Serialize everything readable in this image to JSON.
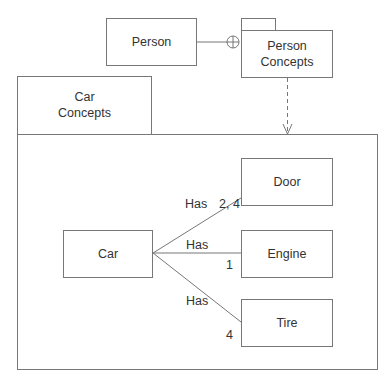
{
  "diagram": {
    "type": "UML package diagram",
    "packages": [
      {
        "id": "person_concepts",
        "name_line1": "Person",
        "name_line2": "Concepts"
      },
      {
        "id": "car_concepts",
        "name_line1": "Car",
        "name_line2": "Concepts"
      }
    ],
    "classes": {
      "person": "Person",
      "car": "Car",
      "door": "Door",
      "engine": "Engine",
      "tire": "Tire"
    },
    "associations": [
      {
        "from": "Car",
        "to": "Door",
        "label": "Has",
        "multiplicity": "2, 4"
      },
      {
        "from": "Car",
        "to": "Engine",
        "label": "Has",
        "multiplicity": "1"
      },
      {
        "from": "Car",
        "to": "Tire",
        "label": "Has",
        "multiplicity": "4"
      }
    ],
    "relations": [
      {
        "from": "Person",
        "to": "Person Concepts",
        "type": "containment (circle-plus)"
      },
      {
        "from": "Person Concepts",
        "to": "Car Concepts",
        "type": "dependency (dashed arrow)"
      }
    ]
  }
}
